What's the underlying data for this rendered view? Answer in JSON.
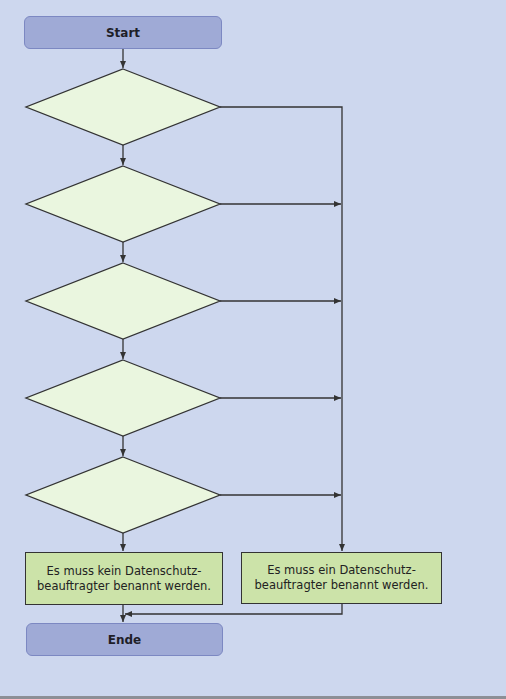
{
  "flowchart": {
    "start_label": "Start",
    "end_label": "Ende",
    "decisions": [
      {
        "id": 1,
        "label": ""
      },
      {
        "id": 2,
        "label": ""
      },
      {
        "id": 3,
        "label": ""
      },
      {
        "id": 4,
        "label": ""
      },
      {
        "id": 5,
        "label": ""
      }
    ],
    "results": {
      "no_officer": "Es muss kein Datenschutz-\nbeauftragter benannt werden.",
      "officer_required": "Es muss ein Datenschutz-\nbeauftragter benannt werden."
    },
    "colors": {
      "background": "#cdd7ee",
      "terminal_fill": "#9faad6",
      "decision_fill": "#eaf6df",
      "result_fill": "#cce3a9",
      "line": "#333333"
    }
  }
}
